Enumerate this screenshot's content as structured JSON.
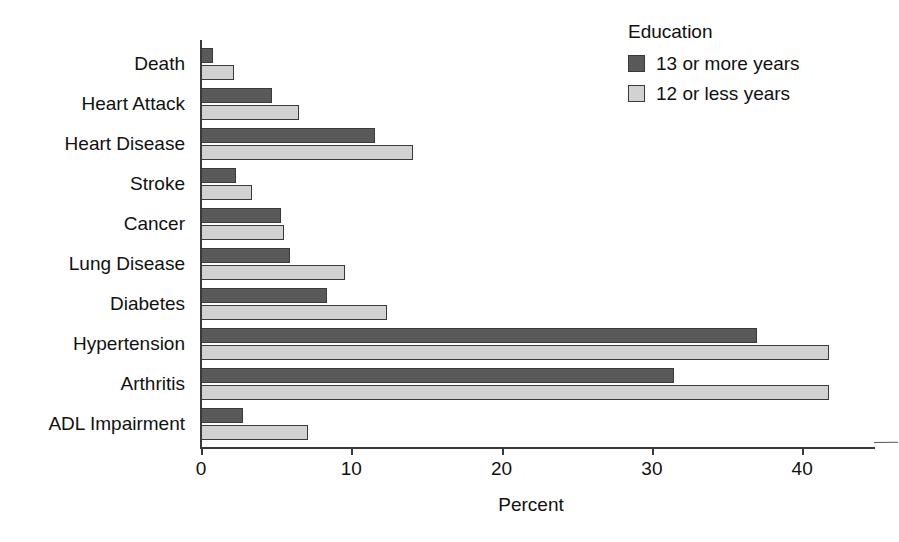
{
  "chart_data": {
    "type": "bar",
    "orientation": "horizontal",
    "title": "",
    "xlabel": "Percent",
    "ylabel": "",
    "xlim": [
      0,
      44.5
    ],
    "xticks": [
      0,
      10,
      20,
      30,
      40
    ],
    "xtick_labels": [
      "0",
      "10",
      "20",
      "30",
      "40"
    ],
    "grid": false,
    "legend_title": "Education",
    "legend_position": "top-right",
    "categories": [
      "Death",
      "Heart Attack",
      "Heart Disease",
      "Stroke",
      "Cancer",
      "Lung Disease",
      "Diabetes",
      "Hypertension",
      "Arthritis",
      "ADL Impairment"
    ],
    "series": [
      {
        "name": "13 or more years",
        "color": "#595959",
        "values": [
          0.8,
          4.7,
          11.6,
          2.3,
          5.3,
          5.9,
          8.4,
          37.0,
          31.5,
          2.8
        ]
      },
      {
        "name": "12 or less years",
        "color": "#d2d2d2",
        "values": [
          2.2,
          6.5,
          14.1,
          3.4,
          5.5,
          9.6,
          12.4,
          41.8,
          41.8,
          7.1
        ]
      }
    ]
  },
  "axis": {
    "x_title": "Percent"
  },
  "legend": {
    "title": "Education",
    "entries": [
      {
        "label": "13 or more years",
        "color": "#595959"
      },
      {
        "label": "12 or less years",
        "color": "#d2d2d2"
      }
    ]
  }
}
